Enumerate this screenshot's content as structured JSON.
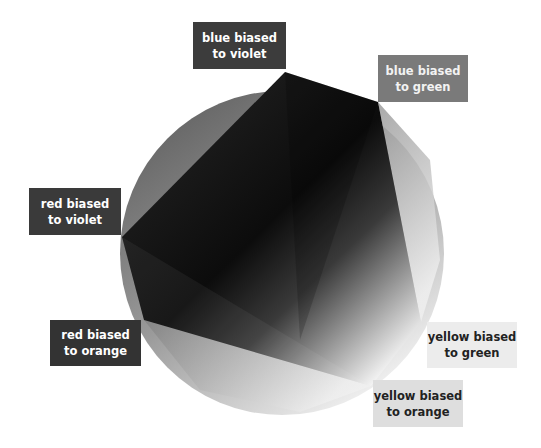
{
  "diagram": {
    "circle": {
      "cx": 282,
      "cy": 253,
      "r": 162
    },
    "polygon_vertices": [
      {
        "id": "blue_violet",
        "x": 285,
        "y": 72
      },
      {
        "id": "blue_green",
        "x": 378,
        "y": 102
      },
      {
        "id": "yellow_green",
        "x": 421,
        "y": 322
      },
      {
        "id": "yellow_orange",
        "x": 371,
        "y": 386
      },
      {
        "id": "red_orange",
        "x": 144,
        "y": 320
      },
      {
        "id": "red_violet",
        "x": 122,
        "y": 237
      }
    ],
    "labels": [
      {
        "id": "blue-violet",
        "line1": "blue biased",
        "line2": "to violet",
        "bg": "#3c3c3c",
        "fg": "#ffffff",
        "x": 193,
        "y": 22,
        "w": 93,
        "h": 47
      },
      {
        "id": "blue-green",
        "line1": "blue biased",
        "line2": "to green",
        "bg": "#7a7a7a",
        "fg": "#f2f2f2",
        "x": 378,
        "y": 55,
        "w": 90,
        "h": 47
      },
      {
        "id": "red-violet",
        "line1": "red biased",
        "line2": "to violet",
        "bg": "#3a3a3a",
        "fg": "#ffffff",
        "x": 29,
        "y": 188,
        "w": 92,
        "h": 47
      },
      {
        "id": "red-orange",
        "line1": "red biased",
        "line2": "to orange",
        "bg": "#333333",
        "fg": "#ffffff",
        "x": 50,
        "y": 320,
        "w": 91,
        "h": 46
      },
      {
        "id": "yellow-green",
        "line1": "yellow biased",
        "line2": "to green",
        "bg": "#ececec",
        "fg": "#222222",
        "x": 427,
        "y": 322,
        "w": 90,
        "h": 46
      },
      {
        "id": "yellow-orange",
        "line1": "yellow biased",
        "line2": "to orange",
        "bg": "#dedede",
        "fg": "#222222",
        "x": 373,
        "y": 380,
        "w": 90,
        "h": 47
      }
    ]
  }
}
